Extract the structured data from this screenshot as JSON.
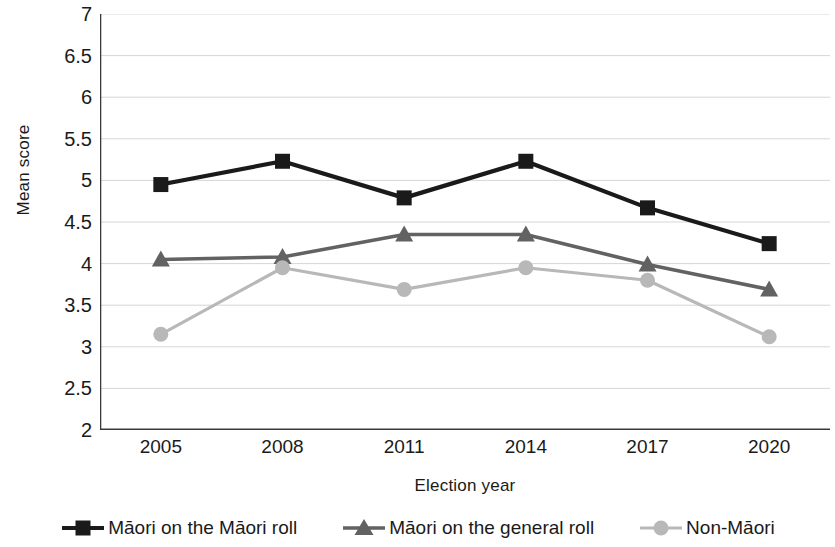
{
  "chart_data": {
    "type": "line",
    "title": "",
    "xlabel": "Election year",
    "ylabel": "Mean score",
    "categories": [
      "2005",
      "2008",
      "2011",
      "2014",
      "2017",
      "2020"
    ],
    "ylim": [
      2,
      7
    ],
    "yticks": [
      "2",
      "2.5",
      "3",
      "3.5",
      "4",
      "4.5",
      "5",
      "5.5",
      "6",
      "6.5",
      "7"
    ],
    "ytick_values": [
      2,
      2.5,
      3,
      3.5,
      4,
      4.5,
      5,
      5.5,
      6,
      6.5,
      7
    ],
    "grid": "horizontal",
    "legend_position": "bottom",
    "series": [
      {
        "name": "Māori on the Māori roll",
        "marker": "square",
        "color": "#1a1a1a",
        "values": [
          4.95,
          5.23,
          4.79,
          5.23,
          4.67,
          4.24
        ]
      },
      {
        "name": "Māori on the general roll",
        "marker": "triangle",
        "color": "#626262",
        "values": [
          4.05,
          4.08,
          4.35,
          4.35,
          3.99,
          3.69
        ]
      },
      {
        "name": "Non-Māori",
        "marker": "circle",
        "color": "#b8b8b8",
        "values": [
          3.15,
          3.95,
          3.69,
          3.95,
          3.8,
          3.12
        ]
      }
    ]
  },
  "axis": {
    "y_title": "Mean score",
    "x_title": "Election year"
  },
  "legend": {
    "items": [
      {
        "label": "Māori on the Māori roll"
      },
      {
        "label": "Māori on the general roll"
      },
      {
        "label": "Non-Māori"
      }
    ]
  }
}
